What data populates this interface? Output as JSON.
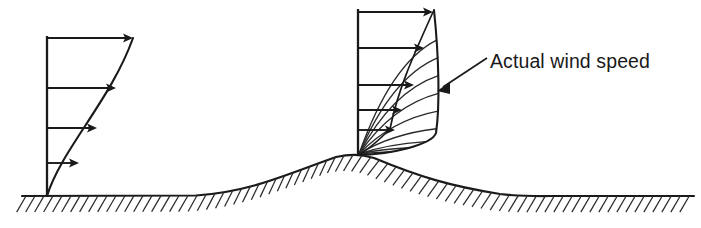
{
  "figure": {
    "background_color": "#ffffff",
    "ink_color": "#1a1a1a",
    "width": 701,
    "height": 228
  },
  "annotations": [
    {
      "name": "actual-wind-speed-label",
      "text": "Actual wind speed",
      "x": 490,
      "y": 68,
      "font_size": 19.5,
      "leader": {
        "from_x": 487,
        "from_y": 58,
        "to_x": 437,
        "to_y": 91
      }
    }
  ],
  "chart_data": {
    "type": "line",
    "xlabel": "Wind speed",
    "ylabel": "Height above ground",
    "grid": false,
    "legend": "none",
    "profiles": [
      {
        "name": "flat-terrain-profile",
        "label": "Undisturbed boundary-layer wind profile over flat ground",
        "base_x": 47,
        "base_y": 196,
        "top_y": 38,
        "axis_height": 158,
        "curve_top_x": 133,
        "arrows": [
          {
            "index": 1,
            "y": 38,
            "x_start": 47,
            "x_end": 133,
            "length": 86,
            "relative_speed": 1.0
          },
          {
            "index": 2,
            "y": 88,
            "x_start": 47,
            "x_end": 116,
            "length": 69,
            "relative_speed": 0.8
          },
          {
            "index": 3,
            "y": 128,
            "x_start": 47,
            "x_end": 97,
            "length": 50,
            "relative_speed": 0.58
          },
          {
            "index": 4,
            "y": 163,
            "x_start": 47,
            "x_end": 79,
            "length": 32,
            "relative_speed": 0.37
          }
        ]
      },
      {
        "name": "hill-crest-profile",
        "label": "Accelerated wind profile at the hill crest",
        "base_x": 358,
        "base_y": 155,
        "top_y": 10,
        "axis_height": 145,
        "curve_top_x": 434,
        "hatched_region": "Speed-up zone between the reference straight profile and the actual accelerated profile",
        "arrows": [
          {
            "index": 1,
            "y": 12,
            "x_start": 358,
            "x_end": 433,
            "length": 75,
            "relative_speed": 1.0
          },
          {
            "index": 2,
            "y": 48,
            "x_start": 358,
            "x_end": 424,
            "length": 66,
            "relative_speed": 0.88
          },
          {
            "index": 3,
            "y": 85,
            "x_start": 358,
            "x_end": 414,
            "length": 56,
            "relative_speed": 0.75
          },
          {
            "index": 4,
            "y": 110,
            "x_start": 358,
            "x_end": 402,
            "length": 44,
            "relative_speed": 0.59
          },
          {
            "index": 5,
            "y": 130,
            "x_start": 358,
            "x_end": 395,
            "length": 37,
            "relative_speed": 0.49
          }
        ],
        "fan_line_count": 9
      }
    ],
    "terrain": {
      "name": "ground-surface",
      "label": "Ground surface with hill",
      "flat_level_y": 196,
      "hill_crest_x": 358,
      "hill_crest_y": 155,
      "hill_start_x": 196,
      "hill_end_x": 560,
      "hatch_side": "below",
      "hatch_spacing": 9,
      "hatch_length": 12
    }
  }
}
